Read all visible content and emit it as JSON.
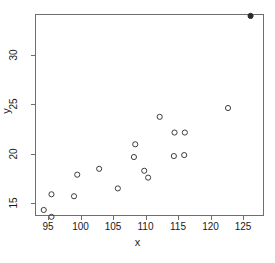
{
  "chart_data": {
    "type": "scatter",
    "title": "",
    "xlabel": "x",
    "ylabel": "y",
    "xlim": [
      93.0,
      128.0
    ],
    "ylim": [
      13.0,
      34.4
    ],
    "xticks": [
      95,
      100,
      105,
      110,
      115,
      120,
      125
    ],
    "yticks": [
      15,
      20,
      25,
      30
    ],
    "grid": false,
    "legend": null,
    "series": [
      {
        "name": "observations",
        "marker": "open-circle",
        "color": "#3c3c3c",
        "points": [
          {
            "x": 94.2,
            "y": 14.2
          },
          {
            "x": 95.4,
            "y": 13.5
          },
          {
            "x": 95.4,
            "y": 15.8
          },
          {
            "x": 98.9,
            "y": 15.6
          },
          {
            "x": 99.4,
            "y": 17.8
          },
          {
            "x": 102.8,
            "y": 18.4
          },
          {
            "x": 105.7,
            "y": 16.4
          },
          {
            "x": 108.2,
            "y": 19.6
          },
          {
            "x": 108.4,
            "y": 20.9
          },
          {
            "x": 109.8,
            "y": 18.2
          },
          {
            "x": 110.4,
            "y": 17.5
          },
          {
            "x": 112.2,
            "y": 23.7
          },
          {
            "x": 114.4,
            "y": 19.7
          },
          {
            "x": 114.5,
            "y": 22.1
          },
          {
            "x": 116.0,
            "y": 19.8
          },
          {
            "x": 116.1,
            "y": 22.1
          },
          {
            "x": 122.8,
            "y": 24.6
          }
        ]
      },
      {
        "name": "outlier",
        "marker": "filled-circle",
        "color": "#2b2b2b",
        "points": [
          {
            "x": 126.3,
            "y": 34.0
          }
        ]
      }
    ]
  }
}
